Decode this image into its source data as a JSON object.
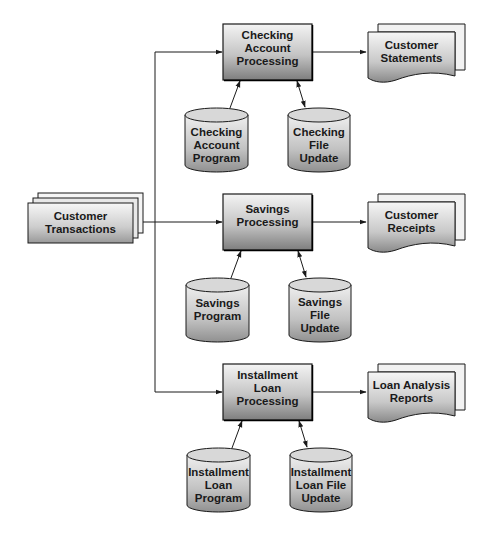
{
  "diagram": {
    "input": {
      "id": "customer-transactions",
      "shape": "card-stack",
      "label": "Customer\nTransactions"
    },
    "processes": [
      {
        "id": "checking-account-processing",
        "label": "Checking\nAccount\nProcessing",
        "output": {
          "label": "Customer\nStatements",
          "shape": "document-stack"
        },
        "program": {
          "label": "Checking\nAccount\nProgram",
          "shape": "cylinder"
        },
        "file": {
          "label": "Checking\nFile\nUpdate",
          "shape": "cylinder"
        }
      },
      {
        "id": "savings-processing",
        "label": "Savings\nProcessing",
        "output": {
          "label": "Customer\nReceipts",
          "shape": "document-stack"
        },
        "program": {
          "label": "Savings\nProgram",
          "shape": "cylinder"
        },
        "file": {
          "label": "Savings\nFile\nUpdate",
          "shape": "cylinder"
        }
      },
      {
        "id": "installment-loan-processing",
        "label": "Installment\nLoan\nProcessing",
        "output": {
          "label": "Loan Analysis\nReports",
          "shape": "document-stack"
        },
        "program": {
          "label": "Installment\nLoan\nProgram",
          "shape": "cylinder"
        },
        "file": {
          "label": "Installment\nLoan File\nUpdate",
          "shape": "cylinder"
        }
      }
    ],
    "edges": [
      {
        "from": "Customer Transactions",
        "to": "Checking Account Processing",
        "type": "arrow"
      },
      {
        "from": "Customer Transactions",
        "to": "Savings Processing",
        "type": "arrow"
      },
      {
        "from": "Customer Transactions",
        "to": "Installment Loan Processing",
        "type": "arrow"
      },
      {
        "from": "Checking Account Processing",
        "to": "Customer Statements",
        "type": "arrow"
      },
      {
        "from": "Savings Processing",
        "to": "Customer Receipts",
        "type": "arrow"
      },
      {
        "from": "Installment Loan Processing",
        "to": "Loan Analysis Reports",
        "type": "arrow"
      },
      {
        "from": "Checking Account Program",
        "to": "Checking Account Processing",
        "type": "arrow"
      },
      {
        "from": "Checking Account Processing",
        "to": "Checking File Update",
        "type": "bidirectional"
      },
      {
        "from": "Savings Program",
        "to": "Savings Processing",
        "type": "arrow"
      },
      {
        "from": "Savings Processing",
        "to": "Savings File Update",
        "type": "bidirectional"
      },
      {
        "from": "Installment Loan Program",
        "to": "Installment Loan Processing",
        "type": "arrow"
      },
      {
        "from": "Installment Loan Processing",
        "to": "Installment Loan File Update",
        "type": "bidirectional"
      }
    ],
    "colors": {
      "stroke": "#1a1a1a",
      "fill_light": "#f2f2f2",
      "fill_dark": "#8c8c8c",
      "text": "#1a1a1a"
    }
  }
}
